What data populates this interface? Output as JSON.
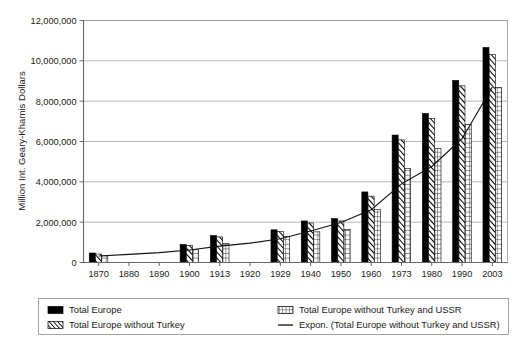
{
  "chart_data": {
    "type": "bar",
    "title": "",
    "xlabel": "",
    "ylabel": "Million Int. Geary-Khamis Dollars",
    "ylim": [
      0,
      12000000
    ],
    "ytick_labels": [
      "0",
      "2,000,000",
      "4,000,000",
      "6,000,000",
      "8,000,000",
      "10,000,000",
      "12,000,000"
    ],
    "ytick_values": [
      0,
      2000000,
      4000000,
      6000000,
      8000000,
      10000000,
      12000000
    ],
    "grid": true,
    "legend_position": "bottom",
    "categories": [
      "1870",
      "1880",
      "1890",
      "1900",
      "1913",
      "1920",
      "1929",
      "1940",
      "1950",
      "1960",
      "1973",
      "1980",
      "1990",
      "2003"
    ],
    "series": [
      {
        "name": "Total Europe",
        "pattern": "solid-black",
        "color": "#000000",
        "values": [
          470000,
          null,
          null,
          890000,
          1340000,
          null,
          1620000,
          2060000,
          2180000,
          3500000,
          6320000,
          7390000,
          9030000,
          10660000
        ]
      },
      {
        "name": "Total Europe without Turkey",
        "pattern": "diagonal-hatch",
        "color": "#000000",
        "values": [
          420000,
          null,
          null,
          840000,
          1270000,
          null,
          1540000,
          1960000,
          2060000,
          3290000,
          6080000,
          7150000,
          8760000,
          10310000
        ]
      },
      {
        "name": "Total Europe without Turkey and USSR",
        "pattern": "grid-hatch",
        "color": "#000000",
        "values": [
          330000,
          null,
          null,
          630000,
          950000,
          null,
          1280000,
          1520000,
          1640000,
          2620000,
          4660000,
          5660000,
          6840000,
          8680000
        ]
      }
    ],
    "trend_series": {
      "name": "Expon. (Total Europe without Turkey and USSR)",
      "type": "line",
      "color": "#111111",
      "x": [
        "1870",
        "1880",
        "1890",
        "1900",
        "1913",
        "1920",
        "1929",
        "1940",
        "1950",
        "1960",
        "1973",
        "1980",
        "1990",
        "2003"
      ],
      "values": [
        320000,
        400000,
        490000,
        620000,
        810000,
        960000,
        1180000,
        1560000,
        1980000,
        2620000,
        3900000,
        4760000,
        6140000,
        8700000
      ]
    },
    "legend_entries": [
      {
        "label": "Total Europe",
        "pattern": "solid-black"
      },
      {
        "label": "Total Europe without Turkey",
        "pattern": "diagonal-hatch"
      },
      {
        "label": "Total Europe without Turkey and USSR",
        "pattern": "grid-hatch"
      },
      {
        "label": "Expon. (Total Europe without Turkey and USSR)",
        "pattern": "line"
      }
    ]
  }
}
